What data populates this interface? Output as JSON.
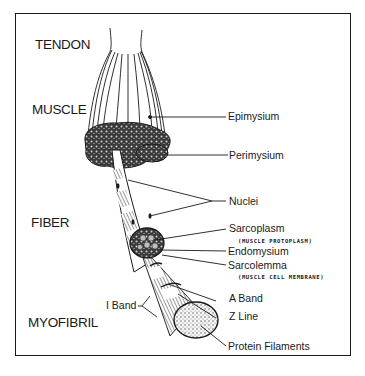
{
  "diagram": {
    "levels": {
      "tendon": "TENDON",
      "muscle": "MUSCLE",
      "fiber": "FIBER",
      "myofibril": "MYOFIBRIL"
    },
    "labels": {
      "epimysium": "Epimysium",
      "perimysium": "Perimysium",
      "nuclei": "Nuclei",
      "sarcoplasm": "Sarcoplasm",
      "sarcoplasm_note": "(MUSCLE PROTOPLASM)",
      "endomysium": "Endomysium",
      "sarcolemma": "Sarcolemma",
      "sarcolemma_note": "(MUSCLE CELL MEMBRANE)",
      "a_band": "A Band",
      "z_line": "Z Line",
      "i_band": "I Band",
      "protein_filaments": "Protein Filaments"
    },
    "colors": {
      "ink": "#1a1a1a",
      "background": "#ffffff",
      "stipple": "#555555"
    }
  }
}
